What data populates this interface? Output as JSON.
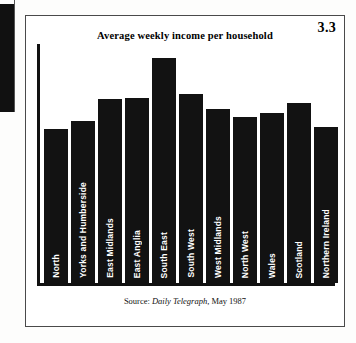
{
  "figure": {
    "number": "3.3",
    "title": "Average weekly income per household",
    "source_prefix": "Source:",
    "source_publication": "Daily Telegraph",
    "source_date": ", May 1987",
    "currency_symbol": "£"
  },
  "chart_data": {
    "type": "bar",
    "title": "Average weekly income per household",
    "xlabel": "",
    "ylabel": "",
    "ylim": [
      0,
      260
    ],
    "grid": false,
    "legend": false,
    "value_prefix": "£",
    "categories": [
      "North",
      "Yorks and Humberside",
      "East Midlands",
      "East Anglia",
      "South East",
      "South West",
      "West Midlands",
      "North West",
      "Wales",
      "Scotland",
      "Northern Ireland"
    ],
    "values": [
      170,
      179,
      203,
      204,
      248,
      208,
      192,
      183,
      187,
      198,
      172
    ],
    "data_labels": [
      "£170",
      "£179",
      "£203",
      "£204",
      "£248",
      "£208",
      "£192",
      "£183",
      "£187",
      "£198",
      "£172"
    ],
    "bar_color": "#121212",
    "label_color": "#ffffff",
    "annotations": [
      "3.3"
    ]
  }
}
